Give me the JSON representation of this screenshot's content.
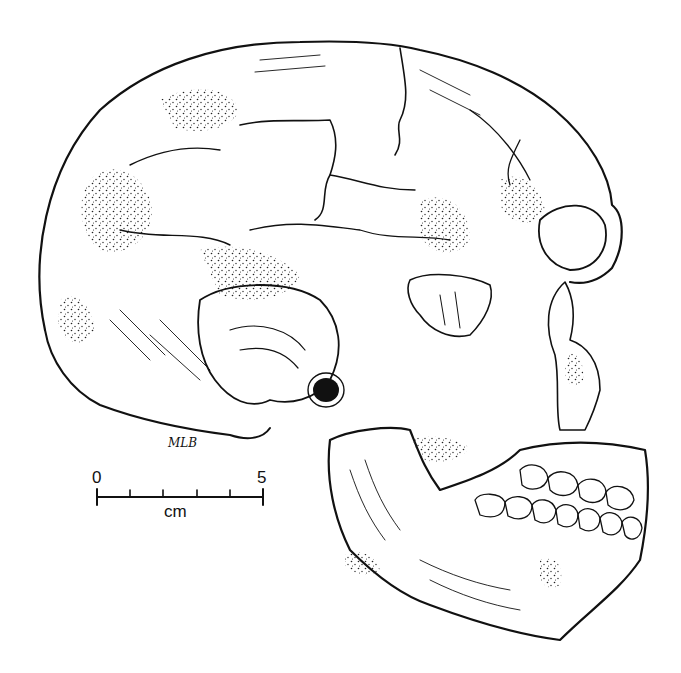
{
  "figure": {
    "artist_signature": "MLB",
    "ink_color": "#111111",
    "background_color": "#ffffff"
  },
  "scale_bar": {
    "start_label": "0",
    "end_label": "5",
    "unit_label": "cm",
    "major_ticks": [
      0,
      1,
      2,
      3,
      4,
      5
    ]
  }
}
